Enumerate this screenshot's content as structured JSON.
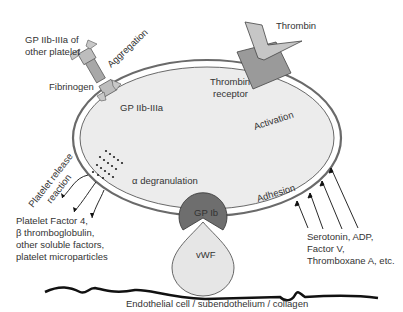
{
  "diagram": {
    "labels": {
      "gp2b3a_other": [
        "GP IIb-IIIa of",
        "other platelet"
      ],
      "aggregation": "Aggregation",
      "fibrinogen": "Fibrinogen",
      "gp2b3a": "GP IIb-IIIa",
      "thrombin": "Thrombin",
      "thrombin_receptor": [
        "Thrombin",
        "receptor"
      ],
      "activation": "Activation",
      "release_reaction": [
        "Platelet release",
        "reaction"
      ],
      "alpha_degranulation": "α degranulation",
      "released_factors": [
        "Platelet Factor 4,",
        "β thromboglobulin,",
        "other soluble factors,",
        "platelet microparticles"
      ],
      "adhesion": "Adhesion",
      "gp1b": "GP Ib",
      "vwf": "vWF",
      "agonists": [
        "Serotonin, ADP,",
        "Factor V,",
        "Thromboxane A, etc."
      ],
      "substrate": "Endothelial cell / subendothelium / collagen"
    },
    "colors": {
      "cell_fill": "#ececec",
      "membrane": "#666666",
      "receptor_dark": "#8c8c8c",
      "receptor_light": "#c8c8c8",
      "gp1b": "#6e6e6e",
      "vwf": "#e8e8e8",
      "text": "#333333"
    }
  }
}
